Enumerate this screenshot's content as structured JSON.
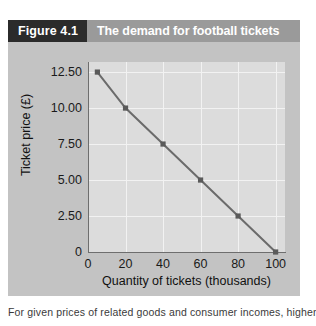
{
  "figure": {
    "number_label": "Figure 4.1",
    "title": "The demand for football tickets",
    "caption": "For given prices of related goods and consumer incomes, higher",
    "colors": {
      "header_bar": "#9a9a9a",
      "number_box": "#2b2b2b",
      "figure_background": "#c3c3c3",
      "plot_background": "#dcdcdc",
      "gridline": "#f2f2f2",
      "axis": "#6e6e6e",
      "series_line": "#6b6b6b",
      "marker": "#5a5a5a",
      "page_background": "#ffffff"
    }
  },
  "chart_data": {
    "type": "line",
    "title": "The demand for football tickets",
    "xlabel": "Quantity of tickets (thousands)",
    "ylabel": "Ticket price (£)",
    "xlim": [
      0,
      105
    ],
    "ylim": [
      0,
      13.2
    ],
    "grid": true,
    "legend": null,
    "xticks": [
      0,
      20,
      40,
      60,
      80,
      100
    ],
    "xtick_labels": [
      "0",
      "20",
      "40",
      "60",
      "80",
      "100"
    ],
    "yticks": [
      0,
      2.5,
      5.0,
      7.5,
      10.0,
      12.5
    ],
    "ytick_labels": [
      "0",
      "2.50",
      "5.00",
      "7.50",
      "10.00",
      "12.50"
    ],
    "series": [
      {
        "name": "Demand",
        "marker": "square",
        "x": [
          5,
          20,
          40,
          60,
          80,
          100
        ],
        "y": [
          12.5,
          10.0,
          7.5,
          5.0,
          2.5,
          0.0
        ]
      }
    ]
  }
}
